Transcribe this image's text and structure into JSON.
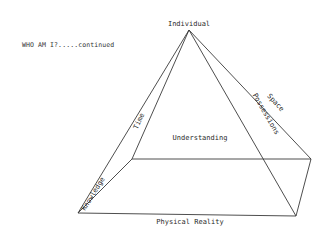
{
  "heading": "WHO AM I?.....continued",
  "diagram": {
    "shape": "pyramid",
    "apex_label": "Individual",
    "base_label": "Physical Reality",
    "center_label": "Understanding",
    "edge_labels": {
      "front_left": "Knowledge",
      "back_left": "Time",
      "front_right": "Possessions",
      "back_right": "Space"
    },
    "line_color": "#3a3a3a",
    "text_color": "#2a2a2a"
  }
}
